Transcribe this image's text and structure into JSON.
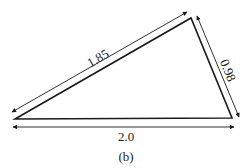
{
  "figure": {
    "caption": "(b)",
    "sides": {
      "left": "1.85",
      "right": "0.98",
      "bottom": "2.0"
    },
    "colors": {
      "stroke": "#1a1a1a",
      "background": "#ffffff"
    }
  }
}
